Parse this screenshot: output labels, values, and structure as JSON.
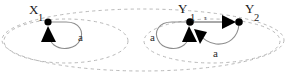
{
  "diagram": {
    "type": "labeled-transition-system",
    "title": "",
    "canvas": {
      "width": 287,
      "height": 75,
      "background": "#ffffff"
    },
    "colors": {
      "node": "#000000",
      "edge": "#8d8d8d",
      "region_boundary": "#b9b9b9",
      "arrowhead": "#000000",
      "label_text": "#1a1a1a"
    },
    "states": [
      {
        "id": "X1",
        "base": "X",
        "subscript": "1",
        "label": "X1",
        "x": 48,
        "y": 22,
        "label_x": 29,
        "label_y": 14,
        "sub_x": 38,
        "sub_y": 21
      },
      {
        "id": "Y1",
        "base": "Y",
        "subscript": "1",
        "label": "Y1",
        "x": 190,
        "y": 22,
        "label_x": 178,
        "label_y": 13,
        "sub_x": 190,
        "sub_y": 21
      },
      {
        "id": "Y2",
        "base": "Y",
        "subscript": "2",
        "label": "Y2",
        "x": 239,
        "y": 22,
        "label_x": 245,
        "label_y": 13,
        "sub_x": 254,
        "sub_y": 21
      }
    ],
    "transitions": [
      {
        "id": "x1-self-a",
        "from": "X1",
        "to": "X1",
        "label": "a",
        "kind": "self-loop",
        "label_x": 78,
        "label_y": 41
      },
      {
        "id": "y1-self-a",
        "from": "Y1",
        "to": "Y1",
        "label": "a",
        "kind": "self-loop",
        "label_x": 150,
        "label_y": 41
      },
      {
        "id": "y1-to-y2-tau",
        "from": "Y1",
        "to": "Y2",
        "label": "τ",
        "kind": "straight",
        "label_x": 210,
        "label_y": 19
      },
      {
        "id": "y2-to-y1-a",
        "from": "Y2",
        "to": "Y1",
        "label": "a",
        "kind": "curved",
        "label_x": 216,
        "label_y": 55
      }
    ],
    "regions": [
      {
        "id": "region-x",
        "name": "left-region",
        "cx": 66,
        "cy": 41,
        "rx": 62,
        "ry": 22,
        "style": "dashed"
      },
      {
        "id": "region-y",
        "name": "right-region",
        "cx": 212,
        "cy": 41,
        "rx": 68,
        "ry": 22,
        "style": "dashed"
      },
      {
        "id": "region-outer",
        "name": "outer-region",
        "cx": 143,
        "cy": 40,
        "rx": 141,
        "ry": 31,
        "style": "dashed"
      }
    ]
  }
}
